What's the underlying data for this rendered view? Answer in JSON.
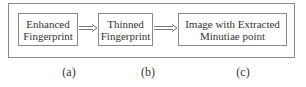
{
  "diagram": {
    "type": "flowchart",
    "nodes": [
      {
        "id": "a",
        "line1": "Enhanced",
        "line2": "Fingerprint",
        "caption": "(a)"
      },
      {
        "id": "b",
        "line1": "Thinned",
        "line2": "Fingerprint",
        "caption": "(b)"
      },
      {
        "id": "c",
        "line1": "Image with Extracted",
        "line2": "Minutiae point",
        "caption": "(c)"
      }
    ],
    "edges": [
      {
        "from": "a",
        "to": "b",
        "style": "double-line-arrow"
      },
      {
        "from": "b",
        "to": "c",
        "style": "double-line-arrow"
      }
    ]
  }
}
